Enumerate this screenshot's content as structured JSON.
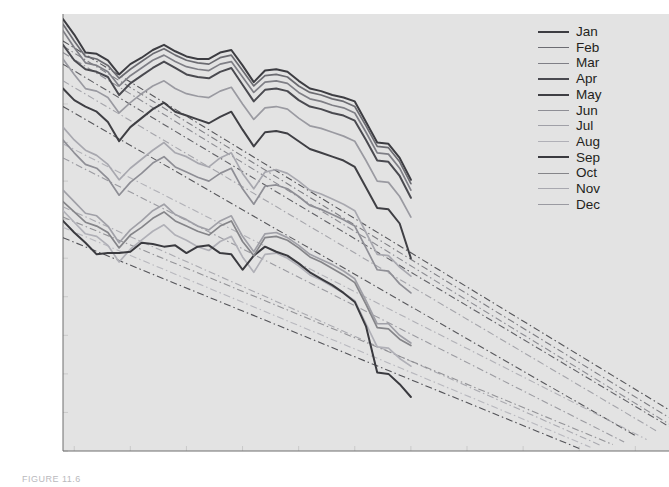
{
  "chart_data": {
    "type": "line",
    "title": "",
    "subtitle": "",
    "xlabel": "",
    "ylabel": "Thousands of km3",
    "ylabel_display": "Thousands of km",
    "ylabel_sup": "3",
    "xlim": [
      1979,
      2033
    ],
    "ylim": [
      0,
      34000
    ],
    "grid": false,
    "legend_position": "upper-right",
    "y_ticks": [
      0,
      3000,
      6000,
      9000,
      12000,
      15000,
      18000,
      21000,
      24000,
      27000,
      30000,
      33000
    ],
    "y_tick_labels": [
      "0",
      "3,000",
      "6,000",
      "9,000",
      "12,000",
      "15,000",
      "18,000",
      "21,000",
      "24,000",
      "27,000",
      "30,000",
      "33,000"
    ],
    "x_ticks": [
      1980,
      1985,
      1990,
      1995,
      2000,
      2005,
      2010,
      2015,
      2020,
      2025,
      2030
    ],
    "x_tick_labels": [
      "1980",
      "1985",
      "1990",
      "1995",
      "2000",
      "2005",
      "2010",
      "2015",
      "2020",
      "2025",
      "2030"
    ],
    "x": [
      1979,
      1980,
      1981,
      1982,
      1983,
      1984,
      1985,
      1986,
      1987,
      1988,
      1989,
      1990,
      1991,
      1992,
      1993,
      1994,
      1995,
      1996,
      1997,
      1998,
      1999,
      2000,
      2001,
      2002,
      2003,
      2004,
      2005,
      2006,
      2007,
      2008,
      2009,
      2010
    ],
    "series": [
      {
        "name": "Jan",
        "color": "#3d3d42",
        "width": 2.0,
        "values": [
          33600,
          32400,
          31000,
          30900,
          30400,
          29300,
          30100,
          30600,
          31200,
          31600,
          31100,
          30700,
          30500,
          30500,
          31000,
          31200,
          30000,
          28700,
          29600,
          29700,
          29500,
          28800,
          28200,
          28000,
          27700,
          27500,
          27200,
          25600,
          24000,
          23900,
          22800,
          21100
        ],
        "trend": {
          "start_year": 1979,
          "start_value": 31900,
          "end_year": 2033,
          "end_value": 3200,
          "style": "dash-dot"
        }
      },
      {
        "name": "Feb",
        "color": "#6c6c72",
        "width": 1.7,
        "values": [
          33200,
          31900,
          30700,
          30500,
          30000,
          29000,
          29700,
          30300,
          30900,
          31300,
          30800,
          30400,
          30200,
          30100,
          30600,
          30800,
          29600,
          28400,
          29200,
          29300,
          29100,
          28400,
          27900,
          27700,
          27400,
          27200,
          26800,
          25300,
          23700,
          23600,
          22500,
          20800
        ],
        "trend": {
          "start_year": 1979,
          "start_value": 31500,
          "end_year": 2033,
          "end_value": 2600,
          "style": "dash-dot"
        }
      },
      {
        "name": "Mar",
        "color": "#7f7f86",
        "width": 1.7,
        "values": [
          32700,
          31400,
          30200,
          30000,
          29500,
          28400,
          29200,
          29800,
          30400,
          30800,
          30300,
          29900,
          29700,
          29600,
          30100,
          30300,
          29100,
          27900,
          28700,
          28800,
          28600,
          27900,
          27400,
          27200,
          26900,
          26700,
          26300,
          24800,
          23200,
          23100,
          22000,
          20300
        ],
        "trend": {
          "start_year": 1979,
          "start_value": 31000,
          "end_year": 2033,
          "end_value": 2100,
          "style": "dash-dot"
        }
      },
      {
        "name": "Apr",
        "color": "#4a4a50",
        "width": 2.0,
        "values": [
          31600,
          30400,
          29700,
          29500,
          29100,
          27700,
          28600,
          29200,
          29800,
          30300,
          29800,
          29300,
          29100,
          29000,
          29500,
          29800,
          28500,
          27200,
          28100,
          28200,
          28000,
          27300,
          26800,
          26600,
          26300,
          26100,
          25700,
          24200,
          22600,
          22500,
          21400,
          19700
        ],
        "trend": {
          "start_year": 1979,
          "start_value": 30100,
          "end_year": 2033,
          "end_value": 1900,
          "style": "dash-dot"
        }
      },
      {
        "name": "May",
        "color": "#3f3f44",
        "width": 2.0,
        "values": [
          28200,
          27300,
          26800,
          26400,
          25600,
          24100,
          25200,
          25900,
          26600,
          27100,
          26400,
          26100,
          25800,
          25500,
          26000,
          26400,
          25000,
          23700,
          24800,
          24900,
          24700,
          24100,
          23500,
          23200,
          22900,
          22600,
          22100,
          20500,
          18900,
          18800,
          17700,
          15000
        ],
        "trend": {
          "start_year": 1979,
          "start_value": 26800,
          "end_year": 2030,
          "end_value": 1200,
          "style": "dash-dot"
        }
      },
      {
        "name": "Jun",
        "color": "#8e8e95",
        "width": 1.7,
        "values": [
          24200,
          23200,
          22300,
          22000,
          21200,
          19900,
          20900,
          21600,
          22400,
          22900,
          22100,
          21700,
          21300,
          21000,
          21600,
          22000,
          20400,
          19200,
          20600,
          20700,
          20400,
          19800,
          19100,
          18800,
          18400,
          18000,
          17500,
          15800,
          14100,
          14000,
          13000,
          12300
        ],
        "trend": {
          "start_year": 1979,
          "start_value": 22800,
          "end_year": 2029,
          "end_value": 700,
          "style": "dash-dot"
        }
      },
      {
        "name": "Jul",
        "color": "#a0a0a7",
        "width": 1.7,
        "values": [
          20300,
          19400,
          18500,
          18300,
          17500,
          16200,
          17200,
          17900,
          18700,
          19200,
          18400,
          18000,
          17500,
          17200,
          17900,
          18300,
          16700,
          15500,
          16900,
          17000,
          16600,
          16000,
          15300,
          14900,
          14500,
          14000,
          13400,
          11700,
          9900,
          9900,
          9000,
          8400
        ],
        "trend": {
          "start_year": 1979,
          "start_value": 19000,
          "end_year": 2027,
          "end_value": 400,
          "style": "dash-dot"
        }
      },
      {
        "name": "Aug",
        "color": "#b0b0b7",
        "width": 1.7,
        "values": [
          18700,
          17800,
          16900,
          16700,
          16000,
          14700,
          15700,
          16400,
          17100,
          17600,
          16800,
          16400,
          15900,
          15600,
          16300,
          16700,
          15100,
          13900,
          15300,
          15400,
          15000,
          14400,
          13700,
          13300,
          12800,
          12300,
          11700,
          9900,
          8100,
          8000,
          7200,
          6600
        ],
        "trend": {
          "start_year": 1979,
          "start_value": 17400,
          "end_year": 2026,
          "end_value": 300,
          "style": "dash-dot"
        }
      },
      {
        "name": "Sep",
        "color": "#3a3a3f",
        "width": 2.0,
        "values": [
          17900,
          17000,
          16200,
          15300,
          15400,
          15400,
          15500,
          16200,
          16100,
          15900,
          16000,
          15400,
          15900,
          16000,
          15400,
          15300,
          14100,
          15200,
          15900,
          15500,
          15200,
          14600,
          13900,
          13400,
          12900,
          12300,
          11600,
          9700,
          6100,
          6000,
          5200,
          4200
        ],
        "trend": {
          "start_year": 1979,
          "start_value": 16600,
          "end_year": 2025,
          "end_value": 200,
          "style": "dash-dot"
        }
      },
      {
        "name": "Oct",
        "color": "#858589",
        "width": 1.7,
        "values": [
          19400,
          18600,
          17800,
          17500,
          17000,
          15800,
          16800,
          17400,
          18100,
          18600,
          17900,
          17500,
          17100,
          16800,
          17500,
          17900,
          16300,
          15200,
          16600,
          16700,
          16400,
          15800,
          15100,
          14700,
          14200,
          13700,
          13100,
          11400,
          9600,
          9500,
          8700,
          8200
        ],
        "trend": {
          "start_year": 1979,
          "start_value": 18200,
          "end_year": 2028,
          "end_value": 500,
          "style": "dash-dot"
        }
      },
      {
        "name": "Nov",
        "color": "#a8a8af",
        "width": 1.7,
        "values": [
          25200,
          24200,
          23400,
          23000,
          22300,
          21100,
          22000,
          22700,
          23400,
          24000,
          23200,
          22900,
          22400,
          22100,
          22800,
          23200,
          21600,
          20400,
          21700,
          21900,
          21600,
          21000,
          20300,
          20000,
          19600,
          19200,
          18700,
          17000,
          15300,
          15200,
          14300,
          13600
        ],
        "trend": {
          "start_year": 1979,
          "start_value": 23900,
          "end_year": 2031,
          "end_value": 900,
          "style": "dash-dot"
        }
      },
      {
        "name": "Dec",
        "color": "#9a9aa1",
        "width": 1.7,
        "values": [
          30500,
          29300,
          28200,
          28000,
          27500,
          26300,
          27100,
          27800,
          28400,
          28800,
          28200,
          27800,
          27600,
          27500,
          28000,
          28300,
          27000,
          25800,
          26700,
          26800,
          26600,
          25900,
          25300,
          25100,
          24800,
          24500,
          24100,
          22600,
          21000,
          20900,
          19800,
          18200
        ],
        "trend": {
          "start_year": 1979,
          "start_value": 28800,
          "end_year": 2032,
          "end_value": 1500,
          "style": "dash-dot"
        }
      }
    ]
  },
  "legend": {
    "items": [
      "Jan",
      "Feb",
      "Mar",
      "Apr",
      "May",
      "Jun",
      "Jul",
      "Aug",
      "Sep",
      "Oct",
      "Nov",
      "Dec"
    ]
  },
  "colors": {
    "plot_background": "#e3e3e3",
    "page_background": "#f0f0f0",
    "text": "#231f20",
    "axis": "#231f20"
  },
  "caption": {
    "text": "FIGURE 11.6"
  }
}
